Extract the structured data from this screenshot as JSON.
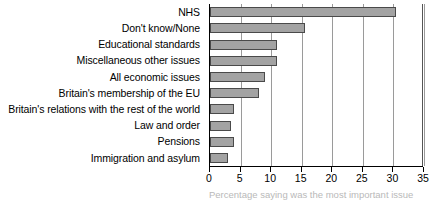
{
  "chart_data": {
    "type": "bar",
    "orientation": "horizontal",
    "title": "",
    "xlabel": "",
    "ylabel": "",
    "xlim": [
      0,
      35
    ],
    "xticks": [
      0,
      5,
      10,
      15,
      20,
      25,
      30,
      35
    ],
    "xtick_labels": [
      "0",
      "5",
      "10",
      "15",
      "20",
      "25",
      "30",
      "35"
    ],
    "grid": true,
    "grid_axis": "x",
    "legend": false,
    "categories": [
      "NHS",
      "Don't know/None",
      "Educational standards",
      "Miscellaneous other issues",
      "All economic issues",
      "Britain's membership of the EU",
      "Britain's relations with the rest of the world",
      "Law and order",
      "Pensions",
      "Immigration and asylum"
    ],
    "values": [
      30.5,
      15.5,
      11,
      11,
      9,
      8,
      4,
      3.5,
      4,
      3
    ],
    "bar_color": "#a3a3a3",
    "bar_border_color": "#4a4a4a",
    "grid_color": "#9a9a9a",
    "axis_color": "#000000"
  },
  "caption": {
    "text": "Percentage saying was the most important issue"
  }
}
